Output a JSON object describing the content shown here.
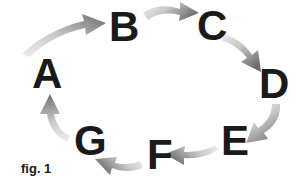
{
  "figure": {
    "caption": "fig. 1",
    "type": "cyclic-process-diagram",
    "background_color": "#ffffff",
    "label_color": "#1a1a1a",
    "arrow_color_light": "#e2e2e2",
    "arrow_color_dark": "#7a7a7a",
    "nodes": [
      {
        "id": "A",
        "label": "A",
        "x": 45,
        "y": 74
      },
      {
        "id": "B",
        "label": "B",
        "x": 122,
        "y": 27
      },
      {
        "id": "C",
        "label": "C",
        "x": 210,
        "y": 26
      },
      {
        "id": "D",
        "label": "D",
        "x": 272,
        "y": 84
      },
      {
        "id": "E",
        "label": "E",
        "x": 233,
        "y": 141
      },
      {
        "id": "F",
        "label": "F",
        "x": 159,
        "y": 155
      },
      {
        "id": "G",
        "label": "G",
        "x": 89,
        "y": 141
      }
    ],
    "edges": [
      {
        "from": "A",
        "to": "B",
        "direction": "up-right"
      },
      {
        "from": "B",
        "to": "C",
        "direction": "right"
      },
      {
        "from": "C",
        "to": "D",
        "direction": "down-right"
      },
      {
        "from": "D",
        "to": "E",
        "direction": "down-left"
      },
      {
        "from": "E",
        "to": "F",
        "direction": "left"
      },
      {
        "from": "F",
        "to": "G",
        "direction": "left"
      },
      {
        "from": "G",
        "to": "A",
        "direction": "up"
      }
    ]
  }
}
